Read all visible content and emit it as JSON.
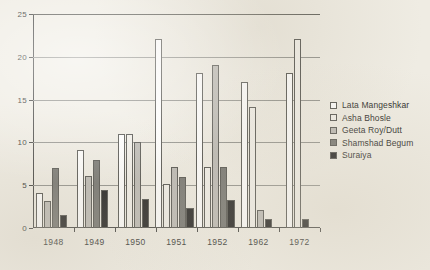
{
  "chart_data": {
    "type": "bar",
    "title": "",
    "subtitle": "",
    "xlabel": "",
    "ylabel": "",
    "categories": [
      "1948",
      "1949",
      "1950",
      "1951",
      "1952",
      "1962",
      "1972"
    ],
    "series": [
      {
        "name": "Lata Mangeshkar",
        "color": "#ffffff",
        "values": [
          4.1,
          9.1,
          11.0,
          22.1,
          18.1,
          17.1,
          18.1
        ]
      },
      {
        "name": "Asha Bhosle",
        "color": "#f2f0ea",
        "values": [
          0,
          0,
          11.0,
          5.1,
          7.1,
          14.1,
          22.1
        ]
      },
      {
        "name": "Geeta Roy/Dutt",
        "color": "#b9b7b2",
        "values": [
          3.1,
          6.1,
          10.0,
          7.1,
          19.1,
          2.1,
          0
        ]
      },
      {
        "name": "Shamshad Begum",
        "color": "#6e6e6a",
        "values": [
          7.0,
          8.0,
          0,
          6.0,
          7.1,
          0,
          0
        ]
      },
      {
        "name": "Suraiya",
        "color": "#151515",
        "values": [
          1.5,
          4.4,
          3.4,
          2.3,
          3.3,
          1.1,
          1.1
        ]
      }
    ],
    "yticks": [
      0,
      5,
      10,
      15,
      20,
      25
    ],
    "ylim": [
      0,
      25
    ],
    "grid": true,
    "legend_position": "right",
    "legend_entries": [
      "Lata Mangeshkar",
      "Asha Bhosle",
      "Geeta Roy/Dutt",
      "Shamshad Begum",
      "Suraiya"
    ],
    "colors": {
      "lata_mangeshkar": "#ffffff",
      "asha_bhosle": "#f2f0ea",
      "geeta_roy_dutt": "#b9b7b2",
      "shamshad_begum": "#6e6e6a",
      "suraiya": "#151515",
      "axis": "#3a3a38",
      "grid": "#8d8d88",
      "background": "#efece3"
    }
  }
}
